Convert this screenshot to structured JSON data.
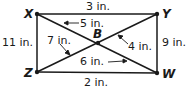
{
  "diagram": {
    "points": {
      "X": {
        "label": "X",
        "x": 37,
        "y": 14
      },
      "Y": {
        "label": "Y",
        "x": 157,
        "y": 14
      },
      "Z": {
        "label": "Z",
        "x": 37,
        "y": 72
      },
      "W": {
        "label": "W",
        "x": 157,
        "y": 73
      },
      "B": {
        "label": "B",
        "x": 98,
        "y": 43
      }
    },
    "measurements": {
      "XY": "3 in.",
      "ZW": "2 in.",
      "XZ": "11 in.",
      "YW": "9 in.",
      "XB": "5 in.",
      "YB": "4 in.",
      "ZB": "7 in.",
      "BW": "6 in."
    },
    "colors": {
      "line": "#1a1a1a",
      "background": "#ffffff"
    }
  }
}
